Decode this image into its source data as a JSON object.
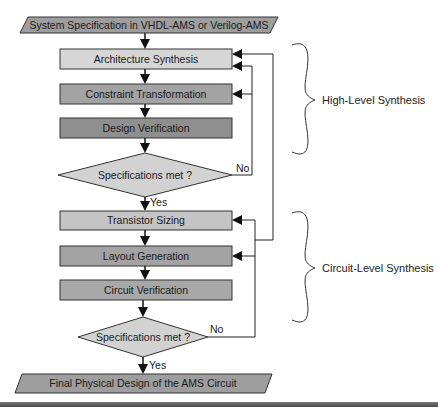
{
  "diagram": {
    "input": "System Specification in VHDL-AMS or Verilog-AMS",
    "high_level": {
      "steps": [
        "Architecture Synthesis",
        "Constraint Transformation",
        "Design Verification"
      ],
      "decision": "Specifications met ?",
      "no_label": "No",
      "yes_label": "Yes",
      "group_label": "High-Level Synthesis"
    },
    "circuit_level": {
      "steps": [
        "Transistor Sizing",
        "Layout Generation",
        "Circuit Verification"
      ],
      "decision": "Specifications met ?",
      "no_label": "No",
      "yes_label": "Yes",
      "group_label": "Circuit-Level Synthesis"
    },
    "output": "Final Physical Design of the AMS Circuit"
  },
  "colors": {
    "io_fill": "#9e9e9e",
    "step_light": "#d6d6d6",
    "step_mid": "#a3a3a3",
    "step_dark": "#8f8f8f",
    "decision_fill": "#d2d2d2",
    "line": "#1a1a1a"
  }
}
